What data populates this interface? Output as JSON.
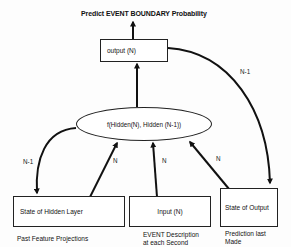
{
  "diagram": {
    "title": "Predict EVENT BOUNDARY Probability",
    "nodes": {
      "output": {
        "label": "output (N)"
      },
      "function": {
        "label": "f(Hidden(N), Hidden (N-1))"
      },
      "hidden_state": {
        "label": "State of Hidden Layer",
        "caption": "Past Feature Projections"
      },
      "input": {
        "label": "Input (N)",
        "caption_line1": "EVENT Description",
        "caption_line2": "at each Second"
      },
      "output_state": {
        "label": "State of Output",
        "caption_line1": "Prediction last",
        "caption_line2": "Made"
      }
    },
    "edges": [
      {
        "from": "output",
        "to": "title",
        "label": ""
      },
      {
        "from": "function",
        "to": "output",
        "label": ""
      },
      {
        "from": "output",
        "to": "output_state",
        "label": "N-1"
      },
      {
        "from": "function",
        "to": "hidden_state",
        "label": "N-1"
      },
      {
        "from": "hidden_state",
        "to": "function",
        "label": "N"
      },
      {
        "from": "input",
        "to": "function",
        "label": "N"
      },
      {
        "from": "output_state",
        "to": "function",
        "label": "N"
      }
    ],
    "colors": {
      "line": "#111111",
      "background": "#fdfdfd"
    }
  }
}
